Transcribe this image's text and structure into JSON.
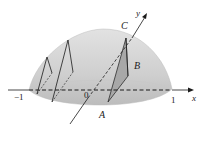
{
  "diagram": {
    "colors": {
      "solid_top": "#d2d2d2",
      "solid_bottom": "#bdbdbd",
      "triangle_shade": "#a9a9a9",
      "line": "#1a1a1a"
    },
    "labels": {
      "axis_x": "x",
      "axis_y": "y",
      "point_A": "A",
      "point_B": "B",
      "point_C": "C",
      "origin": "0",
      "tick_neg1": "−1",
      "tick_1": "1"
    }
  }
}
